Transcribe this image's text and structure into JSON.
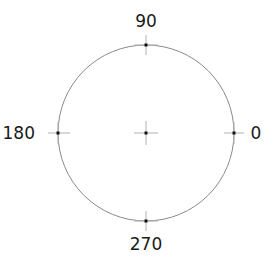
{
  "diagram": {
    "type": "polar-angle-reference",
    "circle": {
      "cx": 146,
      "cy": 133,
      "r": 88,
      "stroke": "#8a8a8a"
    },
    "center_marker": {
      "x": 146,
      "y": 133
    },
    "markers": [
      {
        "angle": 0,
        "label": "0",
        "x": 234,
        "y": 133
      },
      {
        "angle": 90,
        "label": "90",
        "x": 146,
        "y": 45
      },
      {
        "angle": 180,
        "label": "180",
        "x": 58,
        "y": 133
      },
      {
        "angle": 270,
        "label": "270",
        "x": 146,
        "y": 221
      }
    ],
    "colors": {
      "marker": "#111111",
      "tick": "#b0b0b0",
      "text": "#1a1a1a"
    }
  }
}
